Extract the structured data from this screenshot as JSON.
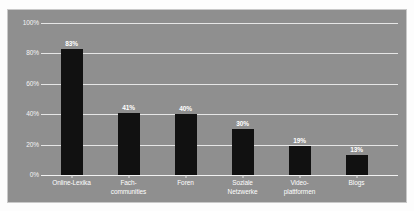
{
  "chart_data": {
    "type": "bar",
    "title": "",
    "subtitle": "",
    "xlabel": "",
    "ylabel": "",
    "ylim": [
      0,
      100
    ],
    "grid": true,
    "legend": "none",
    "categories": [
      "Online-Lexika",
      "Fach-communities",
      "Foren",
      "Soziale Netzwerke",
      "Video-plattformen",
      "Blogs"
    ],
    "category_lines": [
      [
        "Online-Lexika"
      ],
      [
        "Fach-",
        "communities"
      ],
      [
        "Foren"
      ],
      [
        "Soziale",
        "Netzwerke"
      ],
      [
        "Video-",
        "plattformen"
      ],
      [
        "Blogs"
      ]
    ],
    "values": [
      83,
      41,
      40,
      30,
      19,
      13
    ],
    "value_labels": [
      "83%",
      "41%",
      "40%",
      "30%",
      "19%",
      "13%"
    ],
    "y_ticks": [
      100,
      80,
      60,
      40,
      20,
      0
    ],
    "y_tick_labels": [
      "100%",
      "80%",
      "60%",
      "40%",
      "20%",
      "0%"
    ],
    "colors": {
      "bar": "#111111",
      "plot_background": "#8f8f8f",
      "gridline": "#e6e6e6",
      "label_text": "#ffffff",
      "tick_text": "#f4f4f4",
      "panel_border": "#c9c9c9",
      "page_background": "#ffffff"
    }
  }
}
